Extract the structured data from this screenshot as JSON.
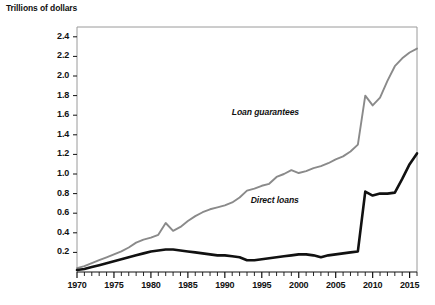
{
  "chart_data": {
    "type": "line",
    "title": "Trillions of dollars",
    "xlabel": "",
    "ylabel": "Trillions of dollars",
    "xlim": [
      1970,
      2016
    ],
    "ylim": [
      0,
      2.5
    ],
    "yticks": [
      "0.2",
      "0.4",
      "0.6",
      "0.8",
      "1.0",
      "1.2",
      "1.4",
      "1.6",
      "1.8",
      "2.0",
      "2.2",
      "2.4"
    ],
    "ytick_values": [
      0.2,
      0.4,
      0.6,
      0.8,
      1.0,
      1.2,
      1.4,
      1.6,
      1.8,
      2.0,
      2.2,
      2.4
    ],
    "xticks": [
      "1970",
      "1975",
      "1980",
      "1985",
      "1990",
      "1995",
      "2000",
      "2005",
      "2010",
      "2015"
    ],
    "xtick_values": [
      1970,
      1975,
      1980,
      1985,
      1990,
      1995,
      2000,
      2005,
      2010,
      2015
    ],
    "minor_tick_interval": 1,
    "grid": false,
    "legend_position": "inline-annotation",
    "x": [
      1970,
      1971,
      1972,
      1973,
      1974,
      1975,
      1976,
      1977,
      1978,
      1979,
      1980,
      1981,
      1982,
      1983,
      1984,
      1985,
      1986,
      1987,
      1988,
      1989,
      1990,
      1991,
      1992,
      1993,
      1994,
      1995,
      1996,
      1997,
      1998,
      1999,
      2000,
      2001,
      2002,
      2003,
      2004,
      2005,
      2006,
      2007,
      2008,
      2009,
      2010,
      2011,
      2012,
      2013,
      2014,
      2015,
      2016
    ],
    "series": [
      {
        "name": "Loan guarantees",
        "color": "#8a8a8a",
        "values": [
          0.04,
          0.06,
          0.09,
          0.12,
          0.15,
          0.18,
          0.21,
          0.25,
          0.3,
          0.33,
          0.35,
          0.38,
          0.5,
          0.42,
          0.46,
          0.52,
          0.57,
          0.61,
          0.64,
          0.66,
          0.68,
          0.71,
          0.76,
          0.83,
          0.85,
          0.88,
          0.9,
          0.97,
          1.0,
          1.04,
          1.01,
          1.03,
          1.06,
          1.08,
          1.11,
          1.15,
          1.18,
          1.23,
          1.3,
          1.8,
          1.7,
          1.78,
          1.95,
          2.1,
          2.18,
          2.24,
          2.28
        ]
      },
      {
        "name": "Direct loans",
        "color": "#111111",
        "values": [
          0.02,
          0.03,
          0.05,
          0.07,
          0.09,
          0.11,
          0.13,
          0.15,
          0.17,
          0.19,
          0.21,
          0.22,
          0.23,
          0.23,
          0.22,
          0.21,
          0.2,
          0.19,
          0.18,
          0.17,
          0.17,
          0.16,
          0.15,
          0.12,
          0.12,
          0.13,
          0.14,
          0.15,
          0.16,
          0.17,
          0.18,
          0.18,
          0.17,
          0.15,
          0.17,
          0.18,
          0.19,
          0.2,
          0.21,
          0.82,
          0.78,
          0.8,
          0.8,
          0.81,
          0.95,
          1.1,
          1.21
        ]
      }
    ],
    "annotations": [
      {
        "text": "Loan guarantees",
        "x": 2000,
        "y": 1.62
      },
      {
        "text": "Direct loans",
        "x": 2000,
        "y": 0.72
      }
    ]
  },
  "caption": ""
}
